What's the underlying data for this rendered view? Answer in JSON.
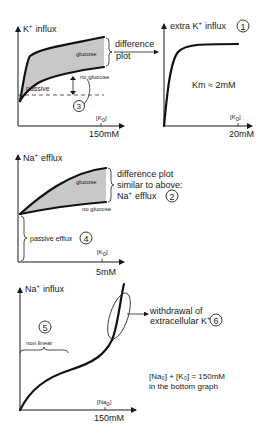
{
  "panels": {
    "k_influx": {
      "ylabel": "K",
      "ylabel_sup": "+",
      "ylabel_rest": "influx",
      "region_label": "glucose",
      "lower_curve_label": "no glucose",
      "passive_label": "passive",
      "circle_number": "3",
      "xlabel": "[K",
      "xlabel_sub": "0",
      "xlabel_end": "]",
      "x_tick": "150mM",
      "bracket_label_line1": "difference",
      "bracket_label_line2": "plot"
    },
    "extra_k_influx": {
      "ylabel": "extra K",
      "ylabel_sup": "+",
      "ylabel_rest": "influx",
      "circle_number": "1",
      "annotation": "Km ≈ 2mM",
      "xlabel": "[K",
      "xlabel_sub": "0",
      "xlabel_end": "]",
      "x_tick": "20mM"
    },
    "na_efflux": {
      "ylabel": "Na",
      "ylabel_sup": "+",
      "ylabel_rest": "efflux",
      "region_label": "glucose",
      "lower_curve_label": "no glucose",
      "bracket_line1": "difference plot",
      "bracket_line2": "similar to above:",
      "bracket_line3": "Na",
      "bracket_line3_sup": "+",
      "bracket_line3_rest": "efflux",
      "circle_number": "2",
      "passive_label": "passive efflux",
      "passive_circle": "4",
      "xlabel": "[K",
      "xlabel_sub": "0",
      "xlabel_end": "]",
      "x_tick": "5mM"
    },
    "na_influx": {
      "ylabel": "Na",
      "ylabel_sup": "+",
      "ylabel_rest": "influx",
      "circle_number": "5",
      "nonlinear_label": "non linear",
      "withdrawal_line1": "withdrawal of",
      "withdrawal_line2": "extracellular K",
      "withdrawal_sup": "+",
      "withdrawal_circle": "6",
      "xlabel": "[Na",
      "xlabel_sub": "0",
      "xlabel_end": "]",
      "x_tick": "150mM"
    }
  },
  "footnote": {
    "line1": "[Na₀] + [K₀] = 150mM",
    "line2": "in the bottom graph"
  }
}
